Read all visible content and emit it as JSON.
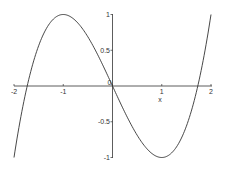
{
  "chart_data": {
    "type": "line",
    "title": "",
    "xlabel": "x",
    "ylabel": "",
    "function": "f(x) = (x^3 - 3x) / 2",
    "xlim": [
      -2,
      2
    ],
    "ylim": [
      -1,
      1
    ],
    "grid": false,
    "legend": null,
    "x_ticks": [
      -2,
      -1,
      0,
      1,
      2
    ],
    "x_tick_labels": [
      "-2",
      "-1",
      "0",
      "1",
      "2"
    ],
    "y_ticks": [
      1,
      0.5,
      -0.5,
      -1
    ],
    "y_tick_labels": [
      "1",
      "0.5",
      "-0.5",
      "-1"
    ],
    "series": [
      {
        "name": "f(x)",
        "color": "#333333",
        "x": [
          -2,
          -1.75,
          -1.5,
          -1.25,
          -1,
          -0.75,
          -0.5,
          -0.25,
          0,
          0.25,
          0.5,
          0.75,
          1,
          1.25,
          1.5,
          1.75,
          2
        ],
        "y": [
          -1,
          0.0547,
          0.5625,
          0.8516,
          1,
          0.9141,
          0.6875,
          0.3672,
          0,
          -0.3672,
          -0.6875,
          -0.9141,
          -1,
          -0.8516,
          -0.5625,
          -0.0547,
          1
        ]
      }
    ],
    "annotations": [
      "x label placed under the tick at x=1"
    ]
  },
  "labels": {
    "x_axis_name": "x",
    "origin": "0"
  },
  "colors": {
    "line": "#333333",
    "axis": "#333333",
    "background": "#ffffff"
  }
}
